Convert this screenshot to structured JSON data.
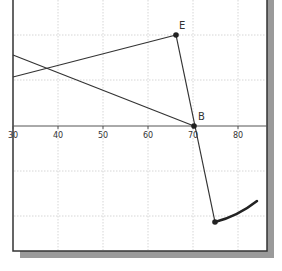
{
  "chart_data": {
    "type": "diagram",
    "x_axis": {
      "ticks": [
        {
          "value": 30,
          "label": "30",
          "px": 13
        },
        {
          "value": 40,
          "label": "40",
          "px": 58
        },
        {
          "value": 50,
          "label": "50",
          "px": 103
        },
        {
          "value": 60,
          "label": "60",
          "px": 148
        },
        {
          "value": 70,
          "label": "70",
          "px": 193
        },
        {
          "value": 80,
          "label": "80",
          "px": 238
        }
      ],
      "y_px": 126
    },
    "grid": {
      "on": true,
      "vertical_px": [
        58,
        103,
        148,
        193,
        238
      ],
      "horizontal_px": [
        35,
        80,
        171,
        216
      ]
    },
    "points": [
      {
        "name": "E",
        "label": "E",
        "px": [
          176,
          35
        ],
        "label_px": [
          179,
          29
        ]
      },
      {
        "name": "B",
        "label": "B",
        "px": [
          194,
          126
        ],
        "label_px": [
          198,
          120
        ]
      },
      {
        "name": "P",
        "label": "",
        "px": [
          215,
          222
        ]
      }
    ],
    "segments": [
      {
        "name": "line-to-E",
        "from": [
          13,
          77
        ],
        "to": [
          176,
          35
        ]
      },
      {
        "name": "line-to-B",
        "from": [
          13,
          55
        ],
        "to": [
          194,
          126
        ]
      },
      {
        "name": "E-to-P",
        "from": [
          176,
          35
        ],
        "to": [
          215,
          222
        ]
      }
    ],
    "curve": {
      "name": "arc",
      "path": "M 215 222 Q 238 216 257 201"
    },
    "colors": {
      "line": "#333333",
      "grid": "#cccccc",
      "axis": "#555555",
      "frame": "#333333",
      "shadow": "#9a9a9a",
      "background": "#ffffff"
    }
  }
}
